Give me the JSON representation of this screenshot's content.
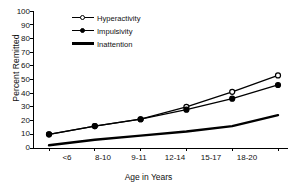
{
  "chart_data": {
    "type": "line",
    "title": "",
    "xlabel": "Age in Years",
    "ylabel": "Percent Remitted",
    "categories": [
      "<6",
      "8-10",
      "9-11",
      "12-14",
      "15-17",
      "18-20"
    ],
    "ylim": [
      0,
      100
    ],
    "yticks": [
      0,
      10,
      20,
      30,
      40,
      50,
      60,
      70,
      80,
      90,
      100
    ],
    "grid": false,
    "legend_position": "upper-left-inside",
    "series": [
      {
        "name": "Hyperactivity",
        "marker": "open-circle",
        "values": [
          10,
          16,
          21,
          30,
          41,
          53
        ]
      },
      {
        "name": "Impulsivity",
        "marker": "filled-circle",
        "values": [
          10,
          16,
          21,
          28,
          36,
          46
        ]
      },
      {
        "name": "Inattention",
        "marker": "none",
        "values": [
          2,
          6,
          9,
          12,
          16,
          24
        ]
      }
    ]
  },
  "axes": {
    "y_title": "Percent Remitted",
    "x_title": "Age in Years",
    "y_labels": [
      "100",
      "90",
      "80",
      "70",
      "60",
      "50",
      "40",
      "30",
      "20",
      "10",
      "0"
    ],
    "x_labels": [
      "<6",
      "8-10",
      "9-11",
      "12-14",
      "15-17",
      "18-20"
    ]
  },
  "legend": {
    "items": [
      {
        "label": "Hyperactivity",
        "marker": "open-circle"
      },
      {
        "label": "Impulsivity",
        "marker": "filled-circle"
      },
      {
        "label": "Inattention",
        "marker": "none"
      }
    ]
  },
  "colors": {
    "line": "#000000",
    "background": "#ffffff",
    "text": "#111111"
  }
}
